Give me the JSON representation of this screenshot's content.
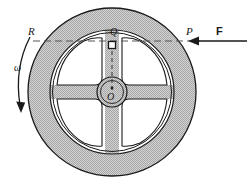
{
  "figure": {
    "background_color": "#ffffff",
    "stroke_color": "#1a1a1a",
    "fill_color": "#c9c9c9",
    "hub_fill_color": "#c9c9c9",
    "opening_fill_color": "#ffffff"
  },
  "labels": {
    "R": "R",
    "P": "P",
    "F": "F",
    "Q": "Q",
    "O": "O",
    "omega": "ω"
  },
  "geometry": {
    "center_x": 112,
    "center_y": 92,
    "outer_radius": 84,
    "rim_inner_radius": 62,
    "hub_radius": 15,
    "hub_inner_radius": 11,
    "spoke_half_width": 7,
    "spoke_count": 4,
    "horizontal_axis_y": 41
  },
  "annotations": {
    "rotation_direction": "counterclockwise",
    "force_direction": "leftward",
    "force_application_point": "P",
    "diametric_line": "R to P",
    "center_point": "O",
    "offset_point": "Q"
  }
}
